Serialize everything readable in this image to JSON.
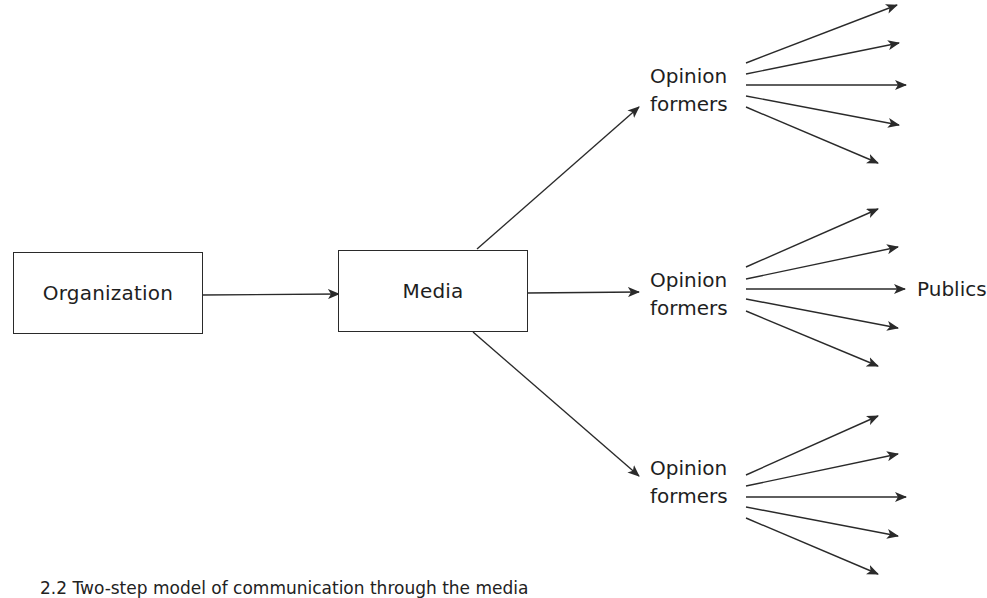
{
  "diagram": {
    "type": "flow",
    "nodes": {
      "organization": {
        "label": "Organization"
      },
      "media": {
        "label": "Media"
      },
      "opinion_formers_top": {
        "line1": "Opinion",
        "line2": "formers"
      },
      "opinion_formers_middle": {
        "line1": "Opinion",
        "line2": "formers"
      },
      "opinion_formers_bottom": {
        "line1": "Opinion",
        "line2": "formers"
      },
      "publics": {
        "label": "Publics"
      }
    },
    "edges": [
      {
        "from": "Organization",
        "to": "Media"
      },
      {
        "from": "Media",
        "to": "Opinion formers (top)"
      },
      {
        "from": "Media",
        "to": "Opinion formers (middle)"
      },
      {
        "from": "Media",
        "to": "Opinion formers (bottom)"
      },
      {
        "from": "Opinion formers (top)",
        "to": "publics",
        "count": 5
      },
      {
        "from": "Opinion formers (middle)",
        "to": "Publics",
        "count": 5
      },
      {
        "from": "Opinion formers (bottom)",
        "to": "publics",
        "count": 5
      }
    ],
    "colors": {
      "stroke": "#2a2a2a",
      "text": "#1e1e1e",
      "background": "#ffffff"
    },
    "caption": "2.2 Two-step model of communication through the media"
  }
}
